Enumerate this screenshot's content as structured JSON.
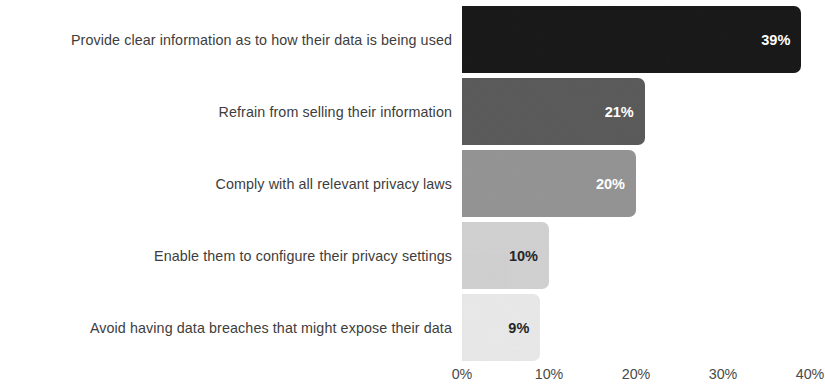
{
  "chart_data": {
    "type": "bar",
    "orientation": "horizontal",
    "title": "",
    "xlabel": "",
    "ylabel": "",
    "xlim": [
      0,
      40
    ],
    "grid": false,
    "legend": false,
    "categories": [
      "Provide clear information as to how their data is being used",
      "Refrain from selling their information",
      "Comply with all relevant privacy laws",
      "Enable them to configure their privacy settings",
      "Avoid having data breaches that might expose their data"
    ],
    "values": [
      39,
      21,
      20,
      10,
      9
    ],
    "value_labels": [
      "39%",
      "21%",
      "20%",
      "10%",
      "9%"
    ],
    "bar_colors": [
      "#141414",
      "#595959",
      "#949494",
      "#d4d4d4",
      "#ededed"
    ],
    "value_label_colors": [
      "#ffffff",
      "#ffffff",
      "#ffffff",
      "#262626",
      "#262626"
    ],
    "x_ticks": [
      0,
      10,
      20,
      30,
      40
    ],
    "x_tick_labels": [
      "0%",
      "10%",
      "20%",
      "30%",
      "40%"
    ],
    "bars": [
      {
        "category": "Provide clear information as to how their data is being used",
        "value": 39,
        "label": "39%",
        "color": "#141414",
        "label_color": "#ffffff"
      },
      {
        "category": "Refrain from selling their information",
        "value": 21,
        "label": "21%",
        "color": "#595959",
        "label_color": "#ffffff"
      },
      {
        "category": "Comply with all relevant privacy laws",
        "value": 20,
        "label": "20%",
        "color": "#949494",
        "label_color": "#ffffff"
      },
      {
        "category": "Enable them to configure their privacy settings",
        "value": 10,
        "label": "10%",
        "color": "#d4d4d4",
        "label_color": "#262626"
      },
      {
        "category": "Avoid having data breaches that might expose their data",
        "value": 9,
        "label": "9%",
        "color": "#ededed",
        "label_color": "#262626"
      }
    ]
  },
  "axis": {
    "category_label_color": "#3d3d3d",
    "tick_label_color": "#4a4a4a"
  }
}
